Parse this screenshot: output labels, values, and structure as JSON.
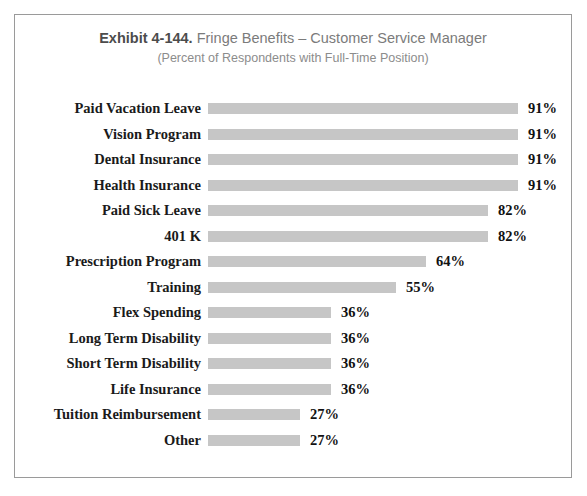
{
  "figure": {
    "frame_color": "#9a9a9a",
    "background": "#ffffff"
  },
  "title": {
    "exhibit_number": "Exhibit 4-144.",
    "main": "Fringe Benefits – Customer Service Manager",
    "subtitle": "(Percent of Respondents with Full-Time Position)"
  },
  "chart_data": {
    "type": "bar",
    "orientation": "horizontal",
    "title": "Exhibit 4-144. Fringe Benefits – Customer Service Manager",
    "subtitle": "(Percent of Respondents with Full-Time Position)",
    "xlabel": "",
    "ylabel": "",
    "xlim": [
      0,
      100
    ],
    "grid": false,
    "legend": false,
    "bar_color": "#c6c6c6",
    "value_suffix": "%",
    "categories": [
      "Paid Vacation Leave",
      "Vision Program",
      "Dental Insurance",
      "Health Insurance",
      "Paid Sick Leave",
      "401 K",
      "Prescription Program",
      "Training",
      "Flex Spending",
      "Long Term Disability",
      "Short Term Disability",
      "Life Insurance",
      "Tuition Reimbursement",
      "Other"
    ],
    "values": [
      91,
      91,
      91,
      91,
      82,
      82,
      64,
      55,
      36,
      36,
      36,
      36,
      27,
      27
    ],
    "value_labels": [
      "91%",
      "91%",
      "91%",
      "91%",
      "82%",
      "82%",
      "64%",
      "55%",
      "36%",
      "36%",
      "36%",
      "36%",
      "27%",
      "27%"
    ]
  }
}
